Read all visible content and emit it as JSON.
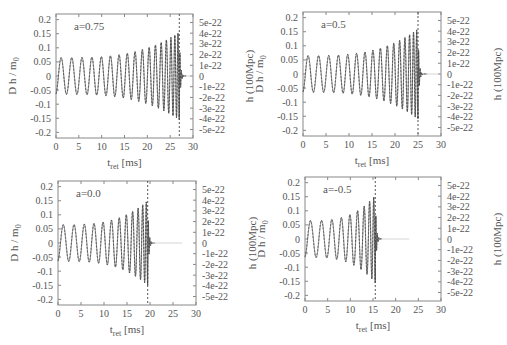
{
  "chart_data": [
    {
      "type": "line",
      "panel": "top-left",
      "annotation": "a=0.75",
      "xlabel": "t_ret [ms]",
      "ylabel_left": "D h / m_0",
      "ylabel_right": "h (100Mpc)",
      "xlim": [
        0,
        30
      ],
      "ylim_left": [
        -0.22,
        0.22
      ],
      "x_ticks": [
        "0",
        "5",
        "10",
        "15",
        "20",
        "25",
        "30"
      ],
      "y_ticks_left": [
        "0.2",
        "0.15",
        "0.1",
        "0.05",
        "0",
        "-0.05",
        "-0.1",
        "-0.15",
        "-0.2"
      ],
      "y_ticks_right": [
        "5e-22",
        "4e-22",
        "3e-22",
        "2e-22",
        "1e-22",
        "0",
        "-1e-22",
        "-2e-22",
        "-3e-22",
        "-4e-22",
        "-5e-22"
      ],
      "merger_time_ms": 27.0,
      "end_time_ms": 28.5,
      "initial_amplitude": 0.065,
      "peak_amplitude": 0.155,
      "cycles": 17,
      "grid": false
    },
    {
      "type": "line",
      "panel": "top-right",
      "annotation": "a=0.5",
      "xlabel": "t_ret [ms]",
      "ylabel_left": "D h / m_0",
      "ylabel_right": "h (100Mpc)",
      "xlim": [
        0,
        30
      ],
      "ylim_left": [
        -0.22,
        0.22
      ],
      "x_ticks": [
        "0",
        "5",
        "10",
        "15",
        "20",
        "25",
        "30"
      ],
      "y_ticks_left": [
        "0.2",
        "0.15",
        "0.1",
        "0.05",
        "0",
        "-0.05",
        "-0.1",
        "-0.15",
        "-0.2"
      ],
      "y_ticks_right": [
        "5e-22",
        "4e-22",
        "3e-22",
        "2e-22",
        "1e-22",
        "0",
        "-1e-22",
        "-2e-22",
        "-3e-22",
        "-4e-22",
        "-5e-22"
      ],
      "merger_time_ms": 25.0,
      "end_time_ms": 27.0,
      "initial_amplitude": 0.065,
      "peak_amplitude": 0.16,
      "cycles": 16,
      "grid": false
    },
    {
      "type": "line",
      "panel": "bottom-left",
      "annotation": "a=0.0",
      "xlabel": "t_ret [ms]",
      "ylabel_left": "D h / m_0",
      "ylabel_right": "h (100Mpc)",
      "xlim": [
        0,
        30
      ],
      "ylim_left": [
        -0.22,
        0.22
      ],
      "x_ticks": [
        "0",
        "5",
        "10",
        "15",
        "20",
        "25",
        "30"
      ],
      "y_ticks_left": [
        "0.2",
        "0.15",
        "0.1",
        "0.05",
        "0",
        "-0.05",
        "-0.1",
        "-0.15",
        "-0.2"
      ],
      "y_ticks_right": [
        "5e-22",
        "4e-22",
        "3e-22",
        "2e-22",
        "1e-22",
        "0",
        "-1e-22",
        "-2e-22",
        "-3e-22",
        "-4e-22",
        "-5e-22"
      ],
      "merger_time_ms": 19.5,
      "end_time_ms": 21.0,
      "initial_amplitude": 0.065,
      "peak_amplitude": 0.15,
      "cycles": 12,
      "grid": false
    },
    {
      "type": "line",
      "panel": "bottom-right",
      "annotation": "a=-0.5",
      "xlabel": "t_ret [ms]",
      "ylabel_left": "D h / m_0",
      "ylabel_right": "h (100Mpc)",
      "xlim": [
        0,
        30
      ],
      "ylim_left": [
        -0.22,
        0.22
      ],
      "x_ticks": [
        "0",
        "5",
        "10",
        "15",
        "20",
        "25",
        "30"
      ],
      "y_ticks_left": [
        "0.2",
        "0.15",
        "0.1",
        "0.05",
        "0",
        "-0.05",
        "-0.1",
        "-0.15",
        "-0.2"
      ],
      "y_ticks_right": [
        "5e-22",
        "4e-22",
        "3e-22",
        "2e-22",
        "1e-22",
        "0",
        "-1e-22",
        "-2e-22",
        "-3e-22",
        "-4e-22",
        "-5e-22"
      ],
      "merger_time_ms": 15.5,
      "end_time_ms": 17.0,
      "initial_amplitude": 0.065,
      "peak_amplitude": 0.155,
      "cycles": 9,
      "grid": false
    }
  ],
  "panels": [
    {
      "id": "p0",
      "left": 56,
      "top": 14,
      "width": 137,
      "height": 124,
      "annotation": "a=0.75"
    },
    {
      "id": "p1",
      "left": 303,
      "top": 12,
      "width": 138,
      "height": 124,
      "annotation": "a=0.5"
    },
    {
      "id": "p2",
      "left": 58,
      "top": 181,
      "width": 138,
      "height": 124,
      "annotation": "a=0.0"
    },
    {
      "id": "p3",
      "left": 305,
      "top": 177,
      "width": 136,
      "height": 124,
      "annotation": "a=-0.5"
    }
  ],
  "colors": {
    "frame": "#888888",
    "text": "#555555",
    "solid_line": "#666666",
    "dashed_line": "#444444"
  }
}
